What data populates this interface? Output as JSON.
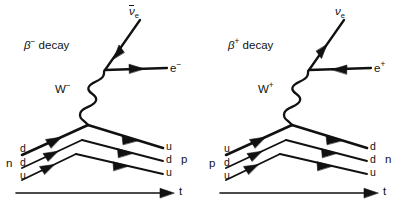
{
  "figure": {
    "kind": "feynman-diagram-pair",
    "background_color": "#ffffff",
    "line_color": "#111111",
    "width": 405,
    "height": 211
  },
  "diagrams": [
    {
      "id": "beta-minus",
      "title_beta": "β",
      "title_charge": "−",
      "title_word": "decay",
      "boson_symbol": "W",
      "boson_charge": "−",
      "neutrino_symbol": "ν",
      "neutrino_sub": "e",
      "neutrino_is_anti": true,
      "lepton_symbol": "e",
      "lepton_charge": "−",
      "initial_hadron": "n",
      "final_hadron": "p",
      "initial_quarks": [
        "d",
        "d",
        "u"
      ],
      "final_quarks": [
        "u",
        "d",
        "u"
      ],
      "axis_label": "t"
    },
    {
      "id": "beta-plus",
      "title_beta": "β",
      "title_charge": "+",
      "title_word": "decay",
      "boson_symbol": "W",
      "boson_charge": "+",
      "neutrino_symbol": "ν",
      "neutrino_sub": "e",
      "neutrino_is_anti": false,
      "lepton_symbol": "e",
      "lepton_charge": "+",
      "initial_hadron": "p",
      "final_hadron": "n",
      "initial_quarks": [
        "u",
        "d",
        "u"
      ],
      "final_quarks": [
        "d",
        "d",
        "u"
      ],
      "axis_label": "t"
    }
  ]
}
